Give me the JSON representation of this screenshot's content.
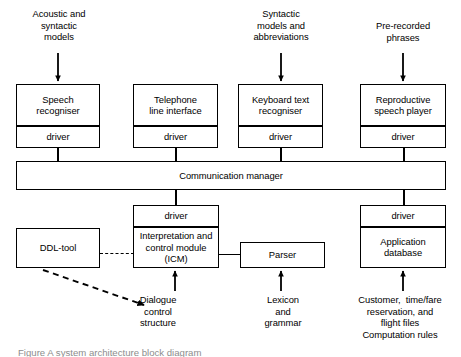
{
  "diagram": {
    "inputs": [
      {
        "id": "acoustic-syntactic-models",
        "text": "Acoustic and\nsyntactic\nmodels"
      },
      {
        "id": "syntactic-models-abbreviations",
        "text": "Syntactic\nmodels and\nabbreviations"
      },
      {
        "id": "pre-recorded-phrases",
        "text": "Pre-recorded\nphrases"
      }
    ],
    "top_modules": [
      {
        "id": "speech-recogniser",
        "name": "Speech\nrecogniser",
        "driver": "driver"
      },
      {
        "id": "telephone-line-interface",
        "name": "Telephone\nline interface",
        "driver": "driver"
      },
      {
        "id": "keyboard-text-recogniser",
        "name": "Keyboard text\nrecogniser",
        "driver": "driver"
      },
      {
        "id": "reproductive-speech-player",
        "name": "Reproductive\nspeech player",
        "driver": "driver"
      }
    ],
    "bus": {
      "id": "communication-manager",
      "label": "Communication    manager"
    },
    "bottom_modules": [
      {
        "id": "ddl-tool",
        "name": "DDL-tool"
      },
      {
        "id": "icm",
        "name": "Interpretation and\ncontrol module\n(ICM)",
        "driver": "driver"
      },
      {
        "id": "parser",
        "name": "Parser"
      },
      {
        "id": "application-database",
        "name": "Application\ndatabase",
        "driver": "driver"
      }
    ],
    "resources": [
      {
        "id": "dialogue-control-structure",
        "text": "Dialogue\ncontrol\nstructure"
      },
      {
        "id": "lexicon-and-grammar",
        "text": "Lexicon\nand\ngrammar"
      },
      {
        "id": "application-files",
        "text": "Customer,  time/fare\nreservation, and\nflight files\nComputation rules"
      }
    ],
    "caption": "Figure   A  system architecture block diagram"
  },
  "colors": {
    "stroke": "#000000",
    "background": "#ffffff",
    "caption": "#8d8d8d"
  }
}
